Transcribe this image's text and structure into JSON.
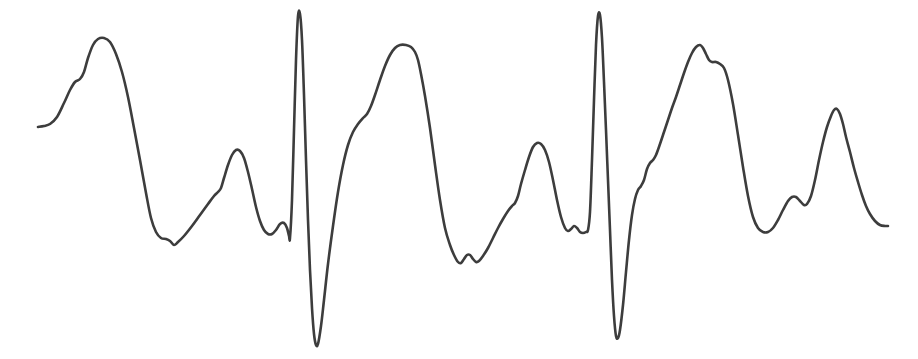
{
  "figure": {
    "name": "ecg-waveform",
    "title": "",
    "width": 918,
    "height": 359,
    "background_color": "#ffffff"
  },
  "chart_data": {
    "type": "line",
    "title": "",
    "subtitle": "",
    "xlabel": "",
    "ylabel": "",
    "xlim": [
      0,
      918
    ],
    "ylim": [
      359,
      0
    ],
    "grid": false,
    "legend": false,
    "legend_position": "none",
    "axes_visible": false,
    "tick_labels_x": [],
    "tick_labels_y": [],
    "annotations": [],
    "series": [
      {
        "name": "ecg-trace",
        "color": "#3d3d3d",
        "line_width": 2.6,
        "smoothing": "cardinal-spline",
        "points": [
          [
            38,
            127
          ],
          [
            44,
            126
          ],
          [
            50,
            124
          ],
          [
            57,
            117
          ],
          [
            64,
            103
          ],
          [
            70,
            90
          ],
          [
            75,
            82
          ],
          [
            80,
            79
          ],
          [
            84,
            72
          ],
          [
            88,
            58
          ],
          [
            93,
            45
          ],
          [
            98,
            39
          ],
          [
            104,
            38
          ],
          [
            110,
            42
          ],
          [
            116,
            54
          ],
          [
            122,
            72
          ],
          [
            128,
            97
          ],
          [
            134,
            128
          ],
          [
            140,
            160
          ],
          [
            146,
            193
          ],
          [
            151,
            218
          ],
          [
            156,
            232
          ],
          [
            161,
            238
          ],
          [
            166,
            239
          ],
          [
            170,
            241
          ],
          [
            174,
            245
          ],
          [
            178,
            242
          ],
          [
            184,
            236
          ],
          [
            192,
            226
          ],
          [
            200,
            215
          ],
          [
            208,
            204
          ],
          [
            214,
            196
          ],
          [
            218,
            192
          ],
          [
            221,
            188
          ],
          [
            224,
            178
          ],
          [
            228,
            165
          ],
          [
            232,
            155
          ],
          [
            236,
            150
          ],
          [
            240,
            151
          ],
          [
            244,
            158
          ],
          [
            248,
            172
          ],
          [
            252,
            189
          ],
          [
            256,
            207
          ],
          [
            260,
            221
          ],
          [
            264,
            230
          ],
          [
            268,
            234
          ],
          [
            272,
            234
          ],
          [
            276,
            230
          ],
          [
            280,
            224
          ],
          [
            284,
            223
          ],
          [
            287,
            228
          ],
          [
            289,
            236
          ],
          [
            290,
            238
          ],
          [
            292,
            200
          ],
          [
            294,
            130
          ],
          [
            296,
            60
          ],
          [
            298,
            16
          ],
          [
            300,
            14
          ],
          [
            302,
            40
          ],
          [
            304,
            95
          ],
          [
            306,
            160
          ],
          [
            308,
            220
          ],
          [
            310,
            270
          ],
          [
            312,
            308
          ],
          [
            314,
            334
          ],
          [
            316,
            345
          ],
          [
            318,
            344
          ],
          [
            321,
            326
          ],
          [
            324,
            300
          ],
          [
            328,
            264
          ],
          [
            333,
            226
          ],
          [
            338,
            192
          ],
          [
            343,
            165
          ],
          [
            348,
            145
          ],
          [
            353,
            132
          ],
          [
            358,
            124
          ],
          [
            363,
            118
          ],
          [
            367,
            114
          ],
          [
            371,
            106
          ],
          [
            375,
            95
          ],
          [
            380,
            80
          ],
          [
            385,
            66
          ],
          [
            390,
            55
          ],
          [
            395,
            48
          ],
          [
            400,
            45
          ],
          [
            406,
            45
          ],
          [
            411,
            47
          ],
          [
            415,
            52
          ],
          [
            418,
            60
          ],
          [
            421,
            74
          ],
          [
            425,
            96
          ],
          [
            430,
            128
          ],
          [
            435,
            165
          ],
          [
            440,
            200
          ],
          [
            445,
            228
          ],
          [
            450,
            245
          ],
          [
            454,
            255
          ],
          [
            458,
            262
          ],
          [
            461,
            263
          ],
          [
            464,
            259
          ],
          [
            467,
            255
          ],
          [
            470,
            255
          ],
          [
            473,
            259
          ],
          [
            476,
            262
          ],
          [
            479,
            261
          ],
          [
            483,
            256
          ],
          [
            488,
            248
          ],
          [
            493,
            238
          ],
          [
            498,
            228
          ],
          [
            503,
            219
          ],
          [
            508,
            211
          ],
          [
            512,
            206
          ],
          [
            515,
            203
          ],
          [
            518,
            196
          ],
          [
            521,
            184
          ],
          [
            525,
            170
          ],
          [
            529,
            157
          ],
          [
            533,
            147
          ],
          [
            537,
            143
          ],
          [
            541,
            144
          ],
          [
            545,
            150
          ],
          [
            549,
            162
          ],
          [
            553,
            180
          ],
          [
            557,
            200
          ],
          [
            561,
            217
          ],
          [
            565,
            228
          ],
          [
            568,
            231
          ],
          [
            571,
            229
          ],
          [
            574,
            226
          ],
          [
            577,
            228
          ],
          [
            580,
            232
          ],
          [
            583,
            233
          ],
          [
            586,
            232
          ],
          [
            588,
            230
          ],
          [
            590,
            212
          ],
          [
            592,
            160
          ],
          [
            594,
            100
          ],
          [
            596,
            45
          ],
          [
            598,
            16
          ],
          [
            600,
            15
          ],
          [
            602,
            38
          ],
          [
            604,
            82
          ],
          [
            606,
            130
          ],
          [
            608,
            180
          ],
          [
            610,
            230
          ],
          [
            612,
            280
          ],
          [
            614,
            316
          ],
          [
            616,
            336
          ],
          [
            618,
            338
          ],
          [
            620,
            330
          ],
          [
            623,
            305
          ],
          [
            626,
            272
          ],
          [
            629,
            240
          ],
          [
            632,
            215
          ],
          [
            635,
            199
          ],
          [
            638,
            190
          ],
          [
            641,
            186
          ],
          [
            644,
            180
          ],
          [
            647,
            169
          ],
          [
            650,
            163
          ],
          [
            653,
            160
          ],
          [
            656,
            155
          ],
          [
            660,
            144
          ],
          [
            664,
            132
          ],
          [
            668,
            120
          ],
          [
            672,
            108
          ],
          [
            676,
            97
          ],
          [
            680,
            85
          ],
          [
            684,
            73
          ],
          [
            688,
            62
          ],
          [
            692,
            53
          ],
          [
            696,
            47
          ],
          [
            700,
            45
          ],
          [
            703,
            48
          ],
          [
            706,
            54
          ],
          [
            709,
            60
          ],
          [
            712,
            62
          ],
          [
            716,
            62
          ],
          [
            720,
            64
          ],
          [
            724,
            68
          ],
          [
            728,
            80
          ],
          [
            733,
            104
          ],
          [
            738,
            135
          ],
          [
            743,
            167
          ],
          [
            748,
            196
          ],
          [
            753,
            217
          ],
          [
            758,
            228
          ],
          [
            763,
            232
          ],
          [
            768,
            232
          ],
          [
            773,
            228
          ],
          [
            778,
            220
          ],
          [
            783,
            210
          ],
          [
            788,
            201
          ],
          [
            792,
            197
          ],
          [
            796,
            197
          ],
          [
            800,
            201
          ],
          [
            804,
            205
          ],
          [
            807,
            204
          ],
          [
            811,
            196
          ],
          [
            815,
            180
          ],
          [
            819,
            160
          ],
          [
            823,
            142
          ],
          [
            827,
            127
          ],
          [
            831,
            116
          ],
          [
            834,
            110
          ],
          [
            837,
            109
          ],
          [
            840,
            114
          ],
          [
            843,
            124
          ],
          [
            846,
            137
          ],
          [
            850,
            152
          ],
          [
            854,
            168
          ],
          [
            858,
            182
          ],
          [
            862,
            195
          ],
          [
            866,
            206
          ],
          [
            870,
            214
          ],
          [
            875,
            221
          ],
          [
            880,
            225
          ],
          [
            885,
            226
          ],
          [
            888,
            226
          ]
        ]
      }
    ]
  }
}
